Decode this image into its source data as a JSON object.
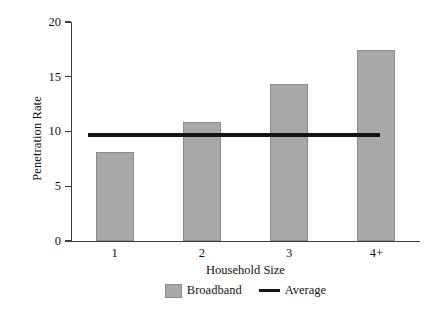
{
  "chart_data": {
    "type": "bar",
    "title": "",
    "xlabel": "Household Size",
    "ylabel": "Penetration Rate",
    "categories": [
      "1",
      "2",
      "3",
      "4+"
    ],
    "series": [
      {
        "name": "Broadband",
        "type": "bar",
        "color": "#a9a9a9",
        "values": [
          8.1,
          10.9,
          14.3,
          17.4
        ]
      },
      {
        "name": "Average",
        "type": "line",
        "color": "#141414",
        "value": 9.7,
        "values": [
          9.7,
          9.7,
          9.7,
          9.7
        ]
      }
    ],
    "ylim": [
      0,
      20
    ],
    "yticks": [
      0,
      5,
      10,
      15,
      20
    ],
    "ytick_labels": [
      "0",
      "5",
      "10",
      "15",
      "20"
    ],
    "grid": false,
    "legend_position": "bottom"
  },
  "legend": {
    "entries": [
      {
        "label": "Broadband",
        "marker": "square-swatch"
      },
      {
        "label": "Average",
        "marker": "line-swatch"
      }
    ]
  }
}
